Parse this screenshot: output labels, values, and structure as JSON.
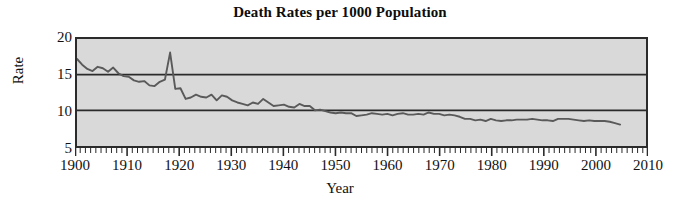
{
  "chart_data": {
    "type": "line",
    "title": "Death Rates per 1000 Population",
    "xlabel": "Year",
    "ylabel": "Rate",
    "xlim": [
      1900,
      2010
    ],
    "ylim": [
      5,
      20
    ],
    "yticks": [
      5,
      10,
      15,
      20
    ],
    "xticks": [
      1900,
      1910,
      1920,
      1930,
      1940,
      1950,
      1960,
      1970,
      1980,
      1990,
      2000,
      2010
    ],
    "grid": "horizontal gridlines at 10 and 15",
    "gridlines": [
      10,
      15
    ],
    "legend": "none",
    "minor_ticks": "one per year on x axis",
    "plot_background": "#d9d9d9",
    "line_color": "#5a5a5a",
    "series": [
      {
        "name": "Death rate per 1000 population",
        "x": [
          1900,
          1901,
          1902,
          1903,
          1904,
          1905,
          1906,
          1907,
          1908,
          1909,
          1910,
          1911,
          1912,
          1913,
          1914,
          1915,
          1916,
          1917,
          1918,
          1919,
          1920,
          1921,
          1922,
          1923,
          1924,
          1925,
          1926,
          1927,
          1928,
          1929,
          1930,
          1931,
          1932,
          1933,
          1934,
          1935,
          1936,
          1937,
          1938,
          1939,
          1940,
          1941,
          1942,
          1943,
          1944,
          1945,
          1946,
          1947,
          1948,
          1949,
          1950,
          1951,
          1952,
          1953,
          1954,
          1955,
          1956,
          1957,
          1958,
          1959,
          1960,
          1961,
          1962,
          1963,
          1964,
          1965,
          1966,
          1967,
          1968,
          1969,
          1970,
          1971,
          1972,
          1973,
          1974,
          1975,
          1976,
          1977,
          1978,
          1979,
          1980,
          1981,
          1982,
          1983,
          1984,
          1985,
          1986,
          1987,
          1988,
          1989,
          1990,
          1991,
          1992,
          1993,
          1994,
          1995,
          1996,
          1997,
          1998,
          1999,
          2000,
          2001,
          2002,
          2003,
          2004,
          2005
        ],
        "values": [
          17.2,
          16.4,
          15.8,
          15.5,
          16.1,
          15.9,
          15.4,
          16.0,
          15.2,
          14.8,
          14.7,
          14.2,
          14.0,
          14.1,
          13.5,
          13.4,
          14.0,
          14.3,
          18.1,
          13.0,
          13.1,
          11.6,
          11.8,
          12.2,
          11.9,
          11.8,
          12.2,
          11.4,
          12.1,
          11.9,
          11.4,
          11.1,
          10.9,
          10.7,
          11.1,
          10.9,
          11.6,
          11.1,
          10.6,
          10.7,
          10.8,
          10.5,
          10.4,
          10.9,
          10.6,
          10.6,
          10.0,
          10.1,
          9.9,
          9.7,
          9.6,
          9.7,
          9.6,
          9.6,
          9.2,
          9.3,
          9.4,
          9.6,
          9.5,
          9.4,
          9.5,
          9.3,
          9.5,
          9.6,
          9.4,
          9.4,
          9.5,
          9.4,
          9.7,
          9.5,
          9.5,
          9.3,
          9.4,
          9.3,
          9.1,
          8.8,
          8.8,
          8.6,
          8.7,
          8.5,
          8.8,
          8.6,
          8.5,
          8.6,
          8.6,
          8.7,
          8.7,
          8.7,
          8.8,
          8.7,
          8.6,
          8.6,
          8.5,
          8.8,
          8.8,
          8.8,
          8.7,
          8.6,
          8.5,
          8.6,
          8.5,
          8.5,
          8.5,
          8.4,
          8.2,
          8.0
        ]
      }
    ]
  }
}
